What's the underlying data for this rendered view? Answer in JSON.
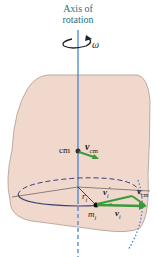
{
  "diagram": {
    "axis_label_line1": "Axis of",
    "axis_label_line2": "rotation",
    "omega": "ω",
    "cm_label": "cm",
    "v_cm_top": "v",
    "v_cm_top_sub": "cm",
    "r_label": "r",
    "r_sub": "i",
    "m_label": "m",
    "m_sub": "i",
    "v_i_prime": "v",
    "v_i_prime_sub": "i",
    "v_i_prime_mark": "′",
    "v_cm_right": "v",
    "v_cm_right_sub": "cm",
    "v_i": "v",
    "v_i_sub": "i",
    "colors": {
      "body_fill": "#f0d8cc",
      "body_stroke": "#b09a8e",
      "axis": "#3a7bd5",
      "vector": "#3a9a3a",
      "orbit": "#3b3f7a",
      "label_title": "#2a6f8a"
    }
  }
}
